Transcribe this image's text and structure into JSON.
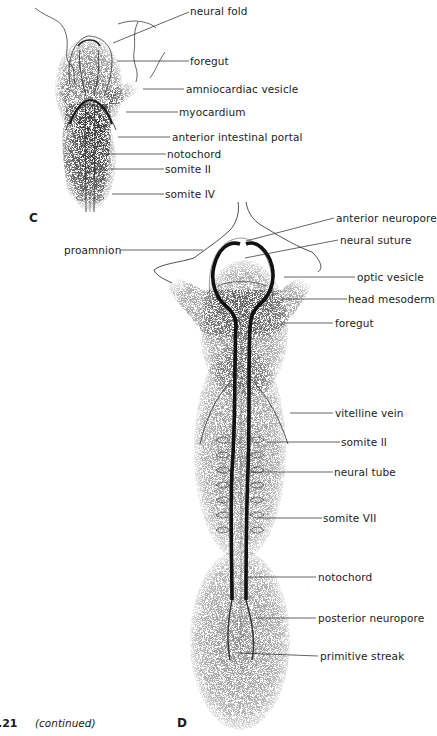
{
  "figure": {
    "number": ".21",
    "continued_label": "(continued)"
  },
  "panels": {
    "C": {
      "letter": "C",
      "labels": [
        "neural fold",
        "foregut",
        "amniocardiac vesicle",
        "myocardium",
        "anterior intestinal portal",
        "notochord",
        "somite II",
        "somite IV"
      ]
    },
    "D": {
      "letter": "D",
      "labels": [
        "anterior neuropore",
        "neural suture",
        "proamnion",
        "optic vesicle",
        "head mesoderm",
        "foregut",
        "vitelline vein",
        "somite II",
        "neural tube",
        "somite VII",
        "notochord",
        "posterior neuropore",
        "primitive streak"
      ]
    }
  },
  "colors": {
    "ink": "#1c1c1c",
    "stipple": "#555555",
    "background": "#ffffff"
  }
}
